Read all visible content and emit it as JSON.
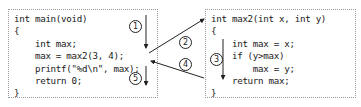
{
  "main_function": {
    "lines": [
      "int main(void)",
      "{",
      "    int max;",
      "    max = max2(3, 4);",
      "    printf(\"%d\\n\", max);",
      "    return 0;",
      "}"
    ]
  },
  "max2_function": {
    "lines": [
      "int max2(int x, int y)",
      "{",
      "    int max = x;",
      "    if (y>max)",
      "        max = y;",
      "    return max;",
      "}"
    ]
  },
  "steps": [
    {
      "id": "1",
      "label": "①",
      "description": "main executes down to call"
    },
    {
      "id": "2",
      "label": "②",
      "description": "call max2"
    },
    {
      "id": "3",
      "label": "③",
      "description": "max2 body executes"
    },
    {
      "id": "4",
      "label": "④",
      "description": "return to main"
    },
    {
      "id": "5",
      "label": "⑤",
      "description": "main continues"
    }
  ],
  "colors": {
    "line": "#222222",
    "border": "#9a9a9a",
    "text": "#1a1a1a"
  }
}
